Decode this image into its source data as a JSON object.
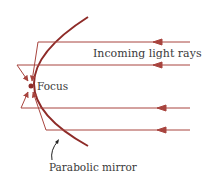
{
  "diagram": {
    "labels": {
      "incoming": "Incoming light rays",
      "focus": "Focus",
      "mirror": "Parabolic mirror"
    },
    "colors": {
      "ray": "#a8443e",
      "mirror": "#8e2b28",
      "text": "#3a3a3a",
      "pointer": "#222222"
    }
  }
}
